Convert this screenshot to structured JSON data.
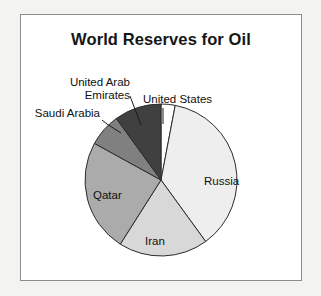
{
  "figure": {
    "title": "World Reserves for Oil",
    "background_color": "#ffffff",
    "border_color": "#8d8d8d",
    "page_background": "#f3f3f1"
  },
  "labels": {
    "russia": "Russia",
    "iran": "Iran",
    "qatar": "Qatar",
    "united_states": "United States",
    "saudi_arabia": "Saudi Arabia",
    "uae_line1": "United Arab",
    "uae_line2": "Emirates"
  },
  "chart_data": {
    "type": "pie",
    "title": "World Reserves for Oil",
    "xlabel": "",
    "ylabel": "",
    "legend": "none",
    "labels_position": "inside-and-callout",
    "start_angle_deg": 90,
    "direction": "clockwise",
    "categories": [
      "United States",
      "Russia",
      "Iran",
      "Qatar",
      "Saudi Arabia",
      "United Arab Emirates"
    ],
    "values": [
      3,
      37,
      19,
      24,
      7,
      10
    ],
    "unit": "percent",
    "colors": [
      "#ffffff",
      "#eeeeee",
      "#d8d8d8",
      "#ababab",
      "#808080",
      "#404040"
    ],
    "slices": [
      {
        "label": "United States",
        "value": 3,
        "color": "#ffffff",
        "label_placement": "callout"
      },
      {
        "label": "Russia",
        "value": 37,
        "color": "#eeeeee",
        "label_placement": "inside"
      },
      {
        "label": "Iran",
        "value": 19,
        "color": "#d8d8d8",
        "label_placement": "inside"
      },
      {
        "label": "Qatar",
        "value": 24,
        "color": "#ababab",
        "label_placement": "inside"
      },
      {
        "label": "Saudi Arabia",
        "value": 7,
        "color": "#808080",
        "label_placement": "callout"
      },
      {
        "label": "United Arab Emirates",
        "value": 10,
        "color": "#404040",
        "label_placement": "callout"
      }
    ]
  }
}
